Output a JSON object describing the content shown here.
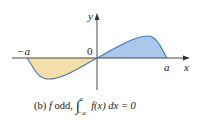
{
  "figure": {
    "axis_labels": {
      "x": "x",
      "y": "y"
    },
    "tick_labels": {
      "neg_a": "−a",
      "zero": "0",
      "pos_a": "a"
    },
    "caption": {
      "part": "(b)",
      "function": "f",
      "property": "odd,",
      "integral_upper": "a",
      "integral_lower": "−a",
      "integrand": "f(x) dx = 0"
    },
    "colors": {
      "negative_region_fill": "#f5dfa8",
      "positive_region_fill": "#a9c8ea",
      "curve": "#3b78c4",
      "axes": "#333333"
    }
  }
}
